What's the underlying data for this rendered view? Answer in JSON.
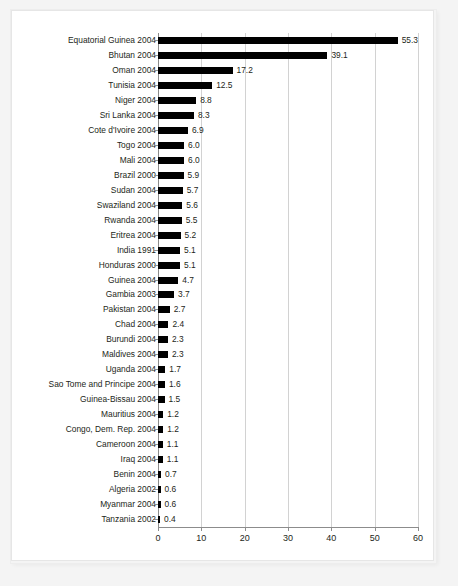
{
  "chart_data": {
    "type": "bar",
    "orientation": "horizontal",
    "title": "",
    "subtitle": "",
    "xlabel": "",
    "ylabel": "",
    "xlim": [
      0,
      60
    ],
    "xticks": [
      0,
      10,
      20,
      30,
      40,
      50,
      60
    ],
    "grid": true,
    "legend": false,
    "bar_color": "#000000",
    "text_color": "#231f20",
    "grid_color": "#d2d2d2",
    "axis_color": "#8c8c8c",
    "background": "#ffffff",
    "frame_color": "#e6e6e6",
    "page_background": "#f4f4f4",
    "categories": [
      "Equatorial Guinea 2004",
      "Bhutan 2004",
      "Oman 2004",
      "Tunisia 2004",
      "Niger 2004",
      "Sri Lanka 2004",
      "Cote d'Ivoire 2004",
      "Togo 2004",
      "Mali 2004",
      "Brazil 2000",
      "Sudan 2004",
      "Swaziland 2004",
      "Rwanda 2004",
      "Eritrea 2004",
      "India 1991",
      "Honduras 2000",
      "Guinea 2004",
      "Gambia 2003",
      "Pakistan 2004",
      "Chad 2004",
      "Burundi 2004",
      "Maldives 2004",
      "Uganda 2004",
      "Sao Tome and Principe 2004",
      "Guinea-Bissau 2004",
      "Mauritius 2004",
      "Congo, Dem. Rep. 2004",
      "Cameroon 2004",
      "Iraq 2004",
      "Benin 2004",
      "Algeria 2002",
      "Myanmar 2004",
      "Tanzania 2002"
    ],
    "values": [
      55.3,
      39.1,
      17.2,
      12.5,
      8.8,
      8.3,
      6.9,
      6.0,
      6.0,
      5.9,
      5.7,
      5.6,
      5.5,
      5.2,
      5.1,
      5.1,
      4.7,
      3.7,
      2.7,
      2.4,
      2.3,
      2.3,
      1.7,
      1.6,
      1.5,
      1.2,
      1.2,
      1.1,
      1.1,
      0.7,
      0.6,
      0.6,
      0.4
    ],
    "value_labels": [
      "55.3",
      "39.1",
      "17.2",
      "12.5",
      "8.8",
      "8.3",
      "6.9",
      "6.0",
      "6.0",
      "5.9",
      "5.7",
      "5.6",
      "5.5",
      "5.2",
      "5.1",
      "5.1",
      "4.7",
      "3.7",
      "2.7",
      "2.4",
      "2.3",
      "2.3",
      "1.7",
      "1.6",
      "1.5",
      "1.2",
      "1.2",
      "1.1",
      "1.1",
      "0.7",
      "0.6",
      "0.6",
      "0.4"
    ],
    "xtick_labels": [
      "0",
      "10",
      "20",
      "30",
      "40",
      "50",
      "60"
    ]
  }
}
